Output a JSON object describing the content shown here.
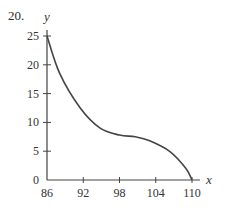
{
  "problem_number": "20.",
  "chart_data": {
    "type": "line",
    "title": "",
    "xlabel": "x",
    "ylabel": "y",
    "xlim": [
      86,
      110
    ],
    "ylim": [
      0,
      25
    ],
    "grid": false,
    "legend": null,
    "x_ticks": [
      86,
      92,
      98,
      104,
      110
    ],
    "y_ticks": [
      0,
      5,
      10,
      15,
      20,
      25
    ],
    "series": [
      {
        "name": "curve",
        "x": [
          86,
          88.1,
          91.5,
          94.8,
          98,
          100.6,
          103,
          106.4,
          109,
          110
        ],
        "y": [
          25,
          18.5,
          12.5,
          9,
          7.8,
          7.5,
          6.8,
          4.9,
          2,
          0
        ]
      }
    ],
    "colors": {
      "axis": "#444444",
      "curve": "#444444"
    }
  }
}
